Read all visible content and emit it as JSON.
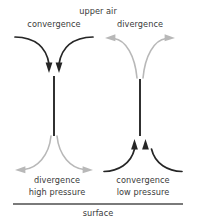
{
  "diagram": {
    "title_top": "upper air",
    "title_bottom": "surface",
    "labels": {
      "upper_left": "convergence",
      "upper_right": "divergence",
      "lower_left_flow": "divergence",
      "lower_left_pressure": "high pressure",
      "lower_right_flow": "convergence",
      "lower_right_pressure": "low pressure"
    },
    "colors": {
      "dark_flow": "#262626",
      "light_flow": "#b3b3b3",
      "surface_line": "#7a7a7a",
      "text": "#3a3a3a",
      "background": "#ffffff"
    },
    "columns": [
      {
        "name": "high-pressure-column",
        "upper_air_flow": "convergence",
        "upper_air_flow_style": "dark",
        "vertical_motion": "subsidence (downward)",
        "surface_flow": "divergence",
        "surface_flow_style": "light",
        "surface_pressure": "high pressure"
      },
      {
        "name": "low-pressure-column",
        "upper_air_flow": "divergence",
        "upper_air_flow_style": "light",
        "vertical_motion": "ascent (upward)",
        "surface_flow": "convergence",
        "surface_flow_style": "dark",
        "surface_pressure": "low pressure"
      }
    ]
  }
}
